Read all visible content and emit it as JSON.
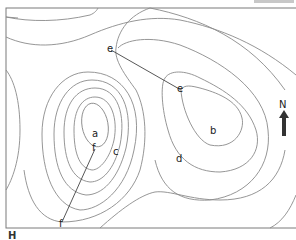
{
  "figure": {
    "type": "contour-map",
    "corner_label": "H",
    "north": {
      "label": "N",
      "color": "#333333"
    },
    "points": [
      {
        "id": "a",
        "label": "a",
        "x": 95,
        "y": 135
      },
      {
        "id": "b",
        "label": "b",
        "x": 213,
        "y": 133
      },
      {
        "id": "c",
        "label": "c",
        "x": 116,
        "y": 155
      },
      {
        "id": "d",
        "label": "d",
        "x": 180,
        "y": 161
      },
      {
        "id": "e1",
        "label": "e",
        "x": 111,
        "y": 50
      },
      {
        "id": "e2",
        "label": "e",
        "x": 181,
        "y": 90
      },
      {
        "id": "f1",
        "label": "f",
        "x": 95,
        "y": 149
      },
      {
        "id": "f2",
        "label": "f",
        "x": 62,
        "y": 225
      }
    ],
    "section_lines": [
      {
        "from": "e1",
        "to": "e2"
      },
      {
        "from": "f1",
        "to": "f2"
      }
    ],
    "colors": {
      "contour": "#8a8a8a",
      "frame": "#7a7a7a",
      "text": "#222222"
    }
  }
}
